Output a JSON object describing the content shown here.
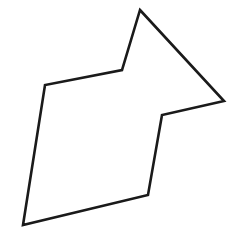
{
  "figure": {
    "canvas": {
      "width": 237,
      "height": 249,
      "background_color": "#ffffff"
    },
    "shape": {
      "name": "closed-polygon",
      "kind": "polygon",
      "vertex_count": 7,
      "fill_color": "#ffffff",
      "stroke_color": "#1a1a1a",
      "stroke_width": 2.6,
      "stroke_linejoin": "miter",
      "points_attr": "140,10 224,101 162,115 148,195 23,225 45,85 122,70",
      "vertices": [
        {
          "label": "top-apex",
          "x": 140,
          "y": 10,
          "type": "convex"
        },
        {
          "label": "right-tip",
          "x": 224,
          "y": 101,
          "type": "convex"
        },
        {
          "label": "right-notch",
          "x": 162,
          "y": 115,
          "type": "concave"
        },
        {
          "label": "bottom-right",
          "x": 148,
          "y": 195,
          "type": "convex"
        },
        {
          "label": "bottom-left",
          "x": 23,
          "y": 225,
          "type": "convex"
        },
        {
          "label": "top-left",
          "x": 45,
          "y": 85,
          "type": "convex"
        },
        {
          "label": "upper-notch",
          "x": 122,
          "y": 70,
          "type": "concave"
        }
      ]
    }
  }
}
